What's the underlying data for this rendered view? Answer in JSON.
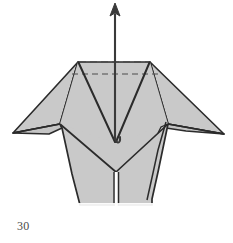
{
  "figure": {
    "type": "origami-folding-diagram",
    "step_number": "30",
    "canvas": {
      "width": 233,
      "height": 243
    },
    "colors": {
      "paper_fill": "#c9c9c9",
      "paper_fill_light": "#d4d4d4",
      "outline": "#2b2b2b",
      "crease_valley": "#333333",
      "hidden_edge_dashed": "#555555",
      "arrow": "#3a3a3a",
      "background": "#ffffff",
      "caption_text": "#4a4a4a"
    },
    "elements": {
      "body_label": "folded paper body",
      "left_flap_label": "left point flap",
      "right_flap_label": "right point flap",
      "center_valley_label": "center valley fold",
      "hidden_edge_label": "hidden edge behind layers",
      "arrow_label": "pull-up fold arrow",
      "bottom_slit_label": "bottom center slit"
    },
    "shapes": {
      "body_outline": "78,62 150,62 168,124 150,168 118,206 110,206 78,168 60,124",
      "left_ear": "78,62 46,134 14,132 8,134 60,124",
      "right_ear": "150,62 168,124 222,133 226,132 186,113",
      "center_v_left": "78,62 115,143",
      "center_v_right": "150,62 115,143",
      "left_inner_crease": "78,62 60,124",
      "right_inner_crease": "150,62 168,124",
      "lower_left_crease": "60,124 116,172",
      "lower_right_crease": "168,124 116,172",
      "bottom_center_split": "116,172 116,205",
      "right_layer_double": "168,124 162,150 158,170 152,196",
      "dashed_top_edge": "78,62 150,62",
      "dashed_inner_edge": "72,74 158,74"
    },
    "arrow": {
      "tip": {
        "x": 115,
        "y": 4
      },
      "tail": {
        "x": 115,
        "y": 144
      },
      "hook_label": "rounded tail hook",
      "head_width": 9,
      "head_height": 11,
      "direction": "up"
    }
  }
}
